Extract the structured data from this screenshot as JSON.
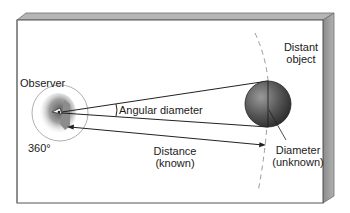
{
  "diagram": {
    "labels": {
      "observer": "Observer",
      "degrees": "360°",
      "angular_diameter": "Angular diameter",
      "distance_line1": "Distance",
      "distance_line2": "(known)",
      "distant_object_line1": "Distant",
      "distant_object_line2": "object",
      "diameter_line1": "Diameter",
      "diameter_line2": "(unknown)"
    },
    "colors": {
      "box_face": "#ffffff",
      "box_edge": "#7a7a7a",
      "box_side": "#9a9a9a",
      "box_top": "#a8a8a8",
      "sphere_dark": "#2e2e2e",
      "sphere_light": "#8a8a8a",
      "line": "#222222",
      "dashed": "#9a9a9a"
    }
  }
}
